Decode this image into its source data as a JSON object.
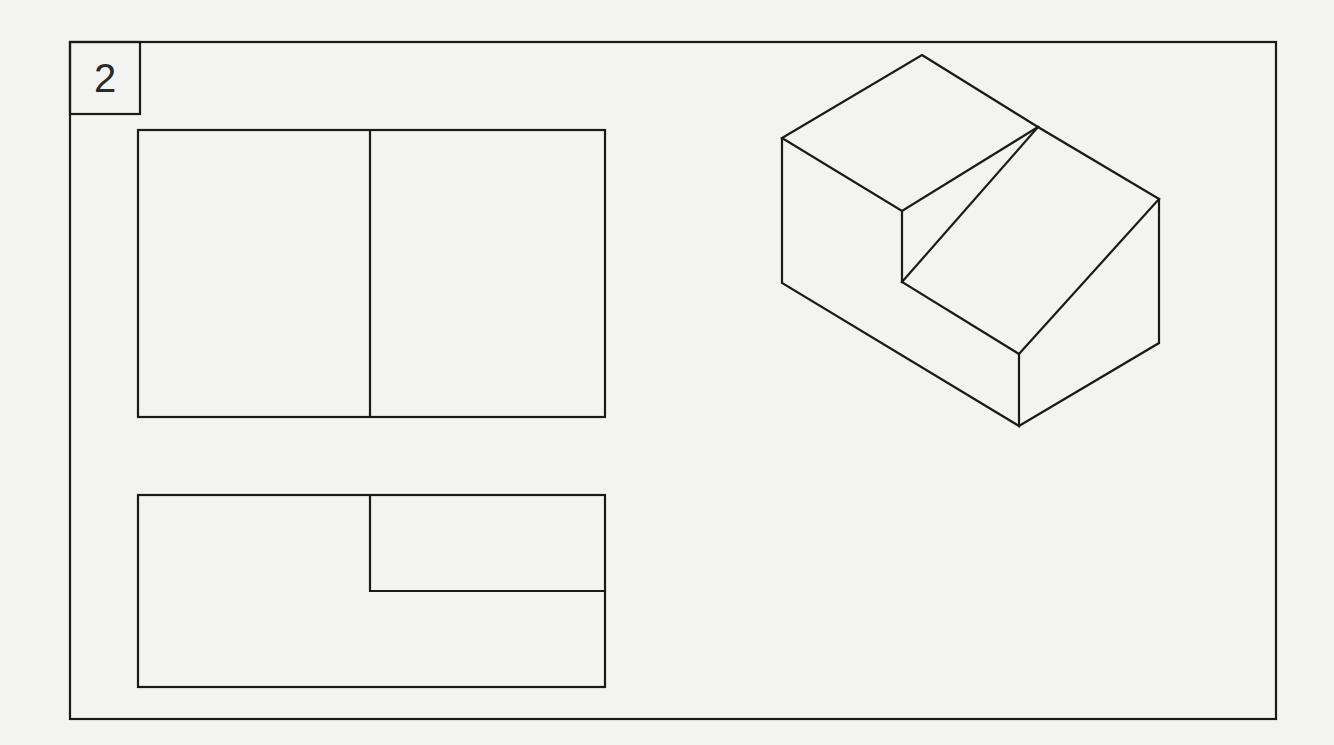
{
  "exercise": {
    "number": "2"
  },
  "colors": {
    "paper": "#f3f3f1",
    "ink": "#1a1a1a"
  },
  "views": {
    "top_view": {
      "name": "orthographic view (upper)"
    },
    "front_view": {
      "name": "orthographic view (lower)"
    },
    "isometric": {
      "name": "isometric pictorial"
    }
  }
}
